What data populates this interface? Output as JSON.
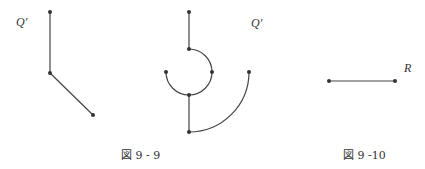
{
  "figures": [
    {
      "id": "fig-9-9-left",
      "label": "Q′",
      "points": [
        [
          50,
          12
        ],
        [
          50,
          73
        ],
        [
          93,
          115
        ]
      ]
    },
    {
      "id": "fig-9-9-right",
      "label": "Q′",
      "points": [
        [
          189,
          12
        ],
        [
          189,
          49
        ],
        [
          212,
          72
        ],
        [
          189,
          95
        ],
        [
          166,
          72
        ],
        [
          189,
          132
        ],
        [
          249,
          72
        ]
      ]
    },
    {
      "id": "fig-9-10",
      "label": "R",
      "points": [
        [
          329,
          81
        ],
        [
          395,
          81
        ]
      ]
    }
  ],
  "captions": {
    "fig_9_9": "図 9 - 9",
    "fig_9_10": "図 9 -10"
  },
  "colors": {
    "stroke": "#444444",
    "text": "#333333"
  }
}
